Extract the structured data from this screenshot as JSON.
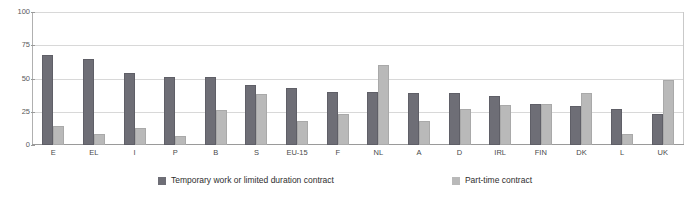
{
  "chart_data": {
    "type": "bar",
    "title": "",
    "xlabel": "",
    "ylabel": "",
    "ylim": [
      0,
      100
    ],
    "yticks": [
      0,
      25,
      50,
      75,
      100
    ],
    "grid": true,
    "legend_position": "bottom",
    "categories": [
      "E",
      "EL",
      "I",
      "P",
      "B",
      "S",
      "EU-15",
      "F",
      "NL",
      "A",
      "D",
      "IRL",
      "FIN",
      "DK",
      "L",
      "UK"
    ],
    "series": [
      {
        "name": "Temporary work or limited duration contract",
        "color": "#6e6e76",
        "values": [
          68,
          65,
          54,
          51,
          51,
          45,
          43,
          40,
          40,
          39,
          39,
          37,
          31,
          29,
          27,
          23
        ]
      },
      {
        "name": "Part-time contract",
        "color": "#b9b9b9",
        "values": [
          14,
          8,
          13,
          7,
          26,
          38,
          18,
          23,
          60,
          18,
          27,
          30,
          31,
          39,
          8,
          49
        ]
      }
    ]
  },
  "legend": {
    "items": [
      {
        "label": "Temporary work or limited duration contract",
        "swatch": "legend-swatch-dark"
      },
      {
        "label": "Part-time contract",
        "swatch": "legend-swatch-light"
      }
    ]
  }
}
